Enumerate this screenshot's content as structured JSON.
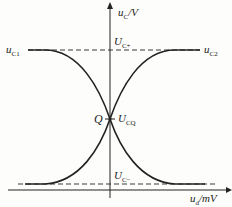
{
  "diagram": {
    "y_axis_label": "u",
    "y_axis_sub": "C",
    "y_axis_unit": "/V",
    "x_axis_label": "u",
    "x_axis_sub": "d",
    "x_axis_unit": "/mV",
    "upper_level_label": "U",
    "upper_level_sub": "C+",
    "lower_level_label": "U",
    "lower_level_sub": "C−",
    "q_label": "Q",
    "q_value_label": "U",
    "q_value_sub": "CQ",
    "curve1_label": "u",
    "curve1_sub": "C1",
    "curve2_label": "u",
    "curve2_sub": "C2",
    "colors": {
      "line": "#222222",
      "background": "#fdfdfb"
    }
  }
}
